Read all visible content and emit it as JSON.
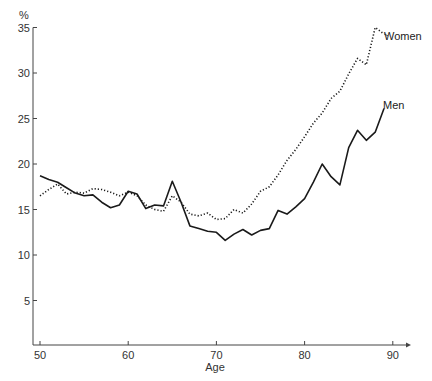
{
  "chart_data": {
    "type": "line",
    "title": "",
    "xlabel": "Age",
    "ylabel": "%",
    "xlim": [
      49.5,
      92
    ],
    "ylim": [
      0,
      35
    ],
    "grid": false,
    "legend": "inline labels at line ends",
    "x_ticks": [
      50,
      60,
      70,
      80,
      90
    ],
    "y_ticks": [
      5,
      10,
      15,
      20,
      25,
      30,
      35
    ],
    "x": [
      50,
      51,
      52,
      53,
      54,
      55,
      56,
      57,
      58,
      59,
      60,
      61,
      62,
      63,
      64,
      65,
      66,
      67,
      68,
      69,
      70,
      71,
      72,
      73,
      74,
      75,
      76,
      77,
      78,
      79,
      80,
      81,
      82,
      83,
      84,
      85,
      86,
      87,
      88,
      89
    ],
    "series": [
      {
        "name": "Men",
        "style": "solid",
        "values": [
          18.7,
          18.3,
          18.0,
          17.4,
          16.8,
          16.5,
          16.6,
          15.8,
          15.2,
          15.5,
          17.0,
          16.7,
          15.1,
          15.5,
          15.4,
          18.1,
          15.8,
          13.2,
          12.9,
          12.6,
          12.5,
          11.6,
          12.3,
          12.8,
          12.2,
          12.7,
          12.9,
          14.9,
          14.5,
          15.3,
          16.2,
          18.0,
          20.0,
          18.6,
          17.7,
          21.8,
          23.7,
          22.6,
          23.5,
          26.1
        ]
      },
      {
        "name": "Women",
        "style": "dotted",
        "values": [
          16.5,
          17.2,
          17.8,
          16.7,
          16.9,
          16.8,
          17.3,
          17.2,
          16.9,
          16.5,
          16.9,
          16.5,
          15.5,
          15.0,
          14.8,
          16.5,
          15.8,
          14.5,
          14.3,
          14.6,
          13.9,
          14.0,
          15.0,
          14.6,
          15.6,
          17.0,
          17.5,
          18.8,
          20.4,
          21.6,
          23.0,
          24.5,
          25.6,
          27.2,
          28.0,
          29.9,
          31.6,
          30.9,
          35.0,
          34.3
        ]
      }
    ]
  },
  "axes": {
    "y_unit_label": "%",
    "x_title": "Age",
    "y_ticks": [
      "5",
      "10",
      "15",
      "20",
      "25",
      "30",
      "35"
    ],
    "x_ticks": [
      "50",
      "60",
      "70",
      "80",
      "90"
    ]
  },
  "labels": {
    "women": "Women",
    "men": "Men"
  }
}
